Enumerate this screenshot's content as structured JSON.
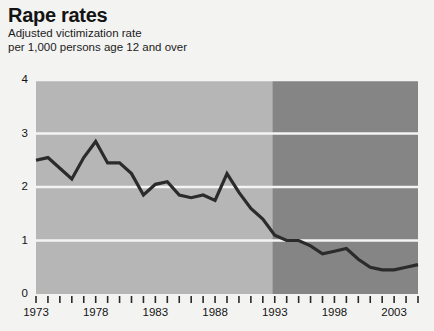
{
  "header": {
    "title": "Rape rates",
    "subtitle_line1": "Adjusted victimization rate",
    "subtitle_line2": "per 1,000 persons age 12 and over"
  },
  "colors": {
    "band_early": "#b6b6b6",
    "band_late": "#858585",
    "line": "#2b2b2b",
    "gridline": "#f4f4f4",
    "text": "#141414",
    "background": "#f3f3f2"
  },
  "chart_data": {
    "type": "line",
    "title": "Rape rates",
    "subtitle": "Adjusted victimization rate per 1,000 persons age 12 and over",
    "xlabel": "",
    "ylabel": "",
    "xlim": [
      1973,
      2005
    ],
    "ylim": [
      0,
      4
    ],
    "yticks": [
      0,
      1,
      2,
      3,
      4
    ],
    "ytick_labels": [
      "0",
      "1",
      "2",
      "3",
      "4"
    ],
    "xticks": [
      1973,
      1974,
      1975,
      1976,
      1977,
      1978,
      1979,
      1980,
      1981,
      1982,
      1983,
      1984,
      1985,
      1986,
      1987,
      1988,
      1989,
      1990,
      1991,
      1992,
      1993,
      1994,
      1995,
      1996,
      1997,
      1998,
      1999,
      2000,
      2001,
      2002,
      2003,
      2004,
      2005
    ],
    "xtick_labels_shown": [
      "1973",
      "1978",
      "1983",
      "1988",
      "1993",
      "1998",
      "2003"
    ],
    "xtick_labels_shown_at": [
      1973,
      1978,
      1983,
      1988,
      1993,
      1998,
      2003
    ],
    "grid": true,
    "grid_axis": "y",
    "legend": false,
    "series": [
      {
        "name": "Adjusted rape victimization rate",
        "x": [
          1973,
          1974,
          1975,
          1976,
          1977,
          1978,
          1979,
          1980,
          1981,
          1982,
          1983,
          1984,
          1985,
          1986,
          1987,
          1988,
          1989,
          1990,
          1991,
          1992,
          1993,
          1994,
          1995,
          1996,
          1997,
          1998,
          1999,
          2000,
          2001,
          2002,
          2003,
          2004,
          2005
        ],
        "values": [
          2.5,
          2.55,
          2.35,
          2.15,
          2.55,
          2.85,
          2.45,
          2.45,
          2.25,
          1.85,
          2.05,
          2.1,
          1.85,
          1.8,
          1.85,
          1.75,
          2.25,
          1.9,
          1.6,
          1.4,
          1.1,
          1.0,
          1.0,
          0.9,
          0.75,
          0.8,
          0.85,
          0.65,
          0.5,
          0.45,
          0.45,
          0.5,
          0.55
        ]
      }
    ],
    "shaded_bands": [
      {
        "name": "1973-1992 period",
        "x_start": 1973,
        "x_end": 1992.8,
        "color": "#b6b6b6"
      },
      {
        "name": "1993-2005 period",
        "x_start": 1992.8,
        "x_end": 2005,
        "color": "#858585"
      }
    ]
  }
}
